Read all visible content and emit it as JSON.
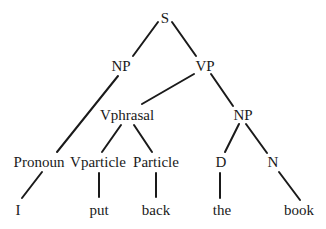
{
  "diagram": {
    "type": "syntax-tree",
    "nodes": {
      "S": {
        "label": "S",
        "x": 165,
        "y": 18
      },
      "NP1": {
        "label": "NP",
        "x": 121,
        "y": 66
      },
      "VP": {
        "label": "VP",
        "x": 205,
        "y": 66
      },
      "Vphrasal": {
        "label": "Vphrasal",
        "x": 127,
        "y": 115
      },
      "NP2": {
        "label": "NP",
        "x": 243,
        "y": 115
      },
      "Pronoun": {
        "label": "Pronoun",
        "x": 39,
        "y": 162
      },
      "Vparticle": {
        "label": "Vparticle",
        "x": 98,
        "y": 162
      },
      "Particle": {
        "label": "Particle",
        "x": 156,
        "y": 162
      },
      "D": {
        "label": "D",
        "x": 221,
        "y": 162
      },
      "N": {
        "label": "N",
        "x": 273,
        "y": 162
      },
      "I": {
        "label": "I",
        "x": 18,
        "y": 210
      },
      "put": {
        "label": "put",
        "x": 99,
        "y": 210
      },
      "back": {
        "label": "back",
        "x": 156,
        "y": 210
      },
      "the": {
        "label": "the",
        "x": 222,
        "y": 210
      },
      "book": {
        "label": "book",
        "x": 299,
        "y": 210
      }
    },
    "edges": [
      {
        "from": "S",
        "to": "NP1",
        "x1": 158,
        "y1": 22,
        "x2": 133,
        "y2": 56
      },
      {
        "from": "S",
        "to": "VP",
        "x1": 172,
        "y1": 22,
        "x2": 196,
        "y2": 56
      },
      {
        "from": "NP1",
        "to": "Pronoun",
        "x1": 118,
        "y1": 76,
        "x2": 57,
        "y2": 152
      },
      {
        "from": "VP",
        "to": "Vphrasal",
        "x1": 194,
        "y1": 74,
        "x2": 142,
        "y2": 104
      },
      {
        "from": "VP",
        "to": "NP2",
        "x1": 211,
        "y1": 74,
        "x2": 233,
        "y2": 106
      },
      {
        "from": "Vphrasal",
        "to": "Vparticle",
        "x1": 121,
        "y1": 125,
        "x2": 102,
        "y2": 152
      },
      {
        "from": "Vphrasal",
        "to": "Particle",
        "x1": 134,
        "y1": 125,
        "x2": 152,
        "y2": 152
      },
      {
        "from": "NP2",
        "to": "D",
        "x1": 239,
        "y1": 124,
        "x2": 225,
        "y2": 152
      },
      {
        "from": "NP2",
        "to": "N",
        "x1": 246,
        "y1": 124,
        "x2": 267,
        "y2": 153
      },
      {
        "from": "Pronoun",
        "to": "I",
        "x1": 42,
        "y1": 172,
        "x2": 22,
        "y2": 198
      },
      {
        "from": "Vparticle",
        "to": "put",
        "x1": 99,
        "y1": 173,
        "x2": 99,
        "y2": 197
      },
      {
        "from": "Particle",
        "to": "back",
        "x1": 156,
        "y1": 173,
        "x2": 156,
        "y2": 197
      },
      {
        "from": "D",
        "to": "the",
        "x1": 220,
        "y1": 173,
        "x2": 220,
        "y2": 198
      },
      {
        "from": "N",
        "to": "book",
        "x1": 279,
        "y1": 172,
        "x2": 300,
        "y2": 200
      }
    ],
    "colors": {
      "ink": "#1a1a1a",
      "background": "#ffffff"
    }
  }
}
